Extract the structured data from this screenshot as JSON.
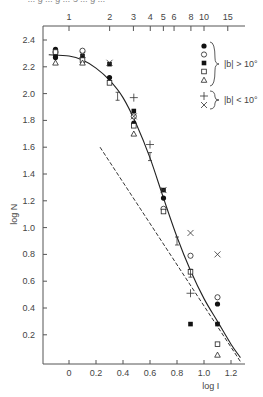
{
  "caption_fragment": "... g ... g ... 5 ... g ...",
  "chart_data": {
    "type": "scatter",
    "title": "",
    "xlabel": "log I",
    "ylabel": "log N",
    "xlim": [
      -0.18,
      1.3
    ],
    "ylim": [
      0.0,
      2.5
    ],
    "x_ticks": [
      0,
      0.2,
      0.4,
      0.6,
      0.8,
      1.0,
      1.2
    ],
    "x_tick_labels": [
      "0",
      "0.2",
      "0.4",
      "0.6",
      "0.8",
      "1.0",
      "1.2"
    ],
    "y_ticks": [
      0.2,
      0.4,
      0.6,
      0.8,
      1.0,
      1.2,
      1.4,
      1.6,
      1.8,
      2.0,
      2.2,
      2.4
    ],
    "y_tick_labels": [
      "0.2",
      "0.4",
      "0.6",
      "0.8",
      "1.0",
      "1.2",
      "1.4",
      "1.6",
      "1.8",
      "2.0",
      "2.2",
      "2.4"
    ],
    "top_axis": {
      "label": "",
      "ticks_linear": [
        1,
        2,
        3,
        4,
        5,
        6,
        8,
        10,
        15
      ],
      "tick_labels": [
        "1",
        "2",
        "3",
        "4",
        "5",
        "6",
        "8",
        "10",
        "15"
      ]
    },
    "grid": false,
    "legend": {
      "position": "upper right",
      "groups": [
        {
          "markers": [
            "filled-circle",
            "open-circle",
            "filled-square",
            "open-square",
            "open-triangle"
          ],
          "label": "|b| > 10°"
        },
        {
          "markers": [
            "plus",
            "cross"
          ],
          "label": "|b| < 10°"
        }
      ]
    },
    "series": [
      {
        "name": "filled-circle",
        "group": "|b| > 10°",
        "x": [
          -0.1,
          -0.1,
          0.3,
          0.48,
          0.7,
          1.1
        ],
        "y": [
          2.33,
          2.27,
          2.12,
          1.78,
          1.22,
          0.43
        ]
      },
      {
        "name": "open-circle",
        "group": "|b| > 10°",
        "x": [
          -0.1,
          0.1,
          0.48,
          0.7,
          0.9,
          1.1
        ],
        "y": [
          2.31,
          2.32,
          1.83,
          1.14,
          0.79,
          0.48
        ]
      },
      {
        "name": "filled-square",
        "group": "|b| > 10°",
        "x": [
          -0.1,
          0.1,
          0.3,
          0.48,
          0.7,
          0.9,
          1.1
        ],
        "y": [
          2.29,
          2.28,
          2.22,
          1.87,
          1.28,
          0.28,
          0.28
        ]
      },
      {
        "name": "open-square",
        "group": "|b| > 10°",
        "x": [
          -0.1,
          0.1,
          0.3,
          0.48,
          0.7,
          0.9,
          1.1
        ],
        "y": [
          2.31,
          2.25,
          2.08,
          1.76,
          1.12,
          0.67,
          0.13
        ]
      },
      {
        "name": "open-triangle",
        "group": "|b| > 10°",
        "x": [
          -0.1,
          0.1,
          0.48,
          1.1
        ],
        "y": [
          2.23,
          2.23,
          1.7,
          0.05
        ]
      },
      {
        "name": "plus",
        "group": "|b| < 10°",
        "x": [
          0.48,
          0.6,
          0.9
        ],
        "y": [
          1.97,
          1.62,
          0.51
        ]
      },
      {
        "name": "cross",
        "group": "|b| < 10°",
        "x": [
          0.1,
          0.3,
          0.48,
          0.7,
          0.9,
          1.1
        ],
        "y": [
          2.29,
          2.23,
          1.83,
          1.28,
          0.96,
          0.8
        ]
      },
      {
        "name": "error-bar-points",
        "x": [
          0.36,
          0.6,
          0.8,
          0.9
        ],
        "y": [
          1.98,
          1.53,
          0.9,
          0.66
        ]
      }
    ],
    "curves": [
      {
        "name": "model-fit",
        "style": "solid",
        "x": [
          -0.15,
          0.0,
          0.1,
          0.2,
          0.3,
          0.4,
          0.5,
          0.6,
          0.7,
          0.8,
          0.9,
          1.0,
          1.1,
          1.2,
          1.27
        ],
        "y": [
          2.29,
          2.28,
          2.25,
          2.19,
          2.1,
          1.97,
          1.77,
          1.52,
          1.22,
          0.93,
          0.68,
          0.47,
          0.3,
          0.13,
          0.03
        ]
      },
      {
        "name": "power-law-asymptote",
        "style": "dashed",
        "x": [
          0.23,
          1.27
        ],
        "y": [
          1.6,
          0.0
        ]
      }
    ]
  }
}
